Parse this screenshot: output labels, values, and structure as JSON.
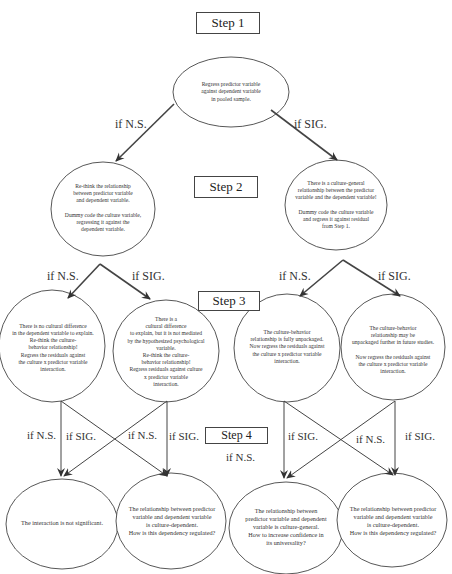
{
  "steps": {
    "step1": "Step 1",
    "step2": "Step 2",
    "step3": "Step 3",
    "step4": "Step 4"
  },
  "nodes": {
    "root": "Regress predictor variable\nagainst dependent variable\nin pooled sample.",
    "step2_ns": "Re-think the relationship\nbetween predictor variable\nand dependent variable.\n\nDummy code the culture variable,\nregressing it against the\ndependent variable.",
    "step2_sig": "There is a culture-general\nrelationship  between the predictor\nvariable and the dependent variable!\n\nDummy code the culture variable\nand regress it against residual\nfrom Step 1.",
    "step3_ns_ns": "There is no cultural difference\nin the dependent variable to explain.\nRe-think the culture-\nbehavior relationship!\nRegress the residuals against\nthe culture x predictor variable\ninteraction.",
    "step3_ns_sig": "There is a\ncultural difference\nto explain, but it is not mediated\nby the hypothesized psychological\nvariable.\nRe-think the culture-\nbehavior relationship!\nRegress residuals against culture\nx predictor variable\ninteraction.",
    "step3_sig_ns": "The culture-behavior\nrelationship is fully unpackaged.\nNow regress the residuals against\nthe culture x predictor variable\ninteraction.",
    "step3_sig_sig": "The culture-behavior\nrelationship may be\nunpackaged further in future studies.\n\nNow regress the residuals against\nthe culture x predictor variable\ninteraction.",
    "step4_a": "The interaction is not significant.",
    "step4_b": "The relationship between predictor\nvariable and dependent variable\nis culture-dependent.\nHow is this dependency regulated?",
    "step4_c": "The relationship between\npredictor variable and dependent\nvariable is culture-general.\nHow to increase confidence in\nits universality?",
    "step4_d": "The relationship between predictor\nvariable and dependent variable\nis culture-dependent.\nHow is this dependency regulated?"
  },
  "edges": {
    "root_ns": "if N.S.",
    "root_sig": "if SIG.",
    "s2l_ns": "if N.S.",
    "s2l_sig": "if SIG.",
    "s2r_ns": "if N.S.",
    "s2r_sig": "if SIG.",
    "s3a_ns": "if N.S.",
    "s3a_sig": "if SIG.",
    "s3b_ns": "if N.S.",
    "s3b_sig": "if SIG.",
    "s3c_sig": "if SIG.",
    "s3c_ns": "if N.S.",
    "s3d_ns": "if N.S.",
    "s3d_sig": "if SIG."
  },
  "colors": {
    "line": "#444444",
    "text": "#333333",
    "background": "#ffffff"
  }
}
